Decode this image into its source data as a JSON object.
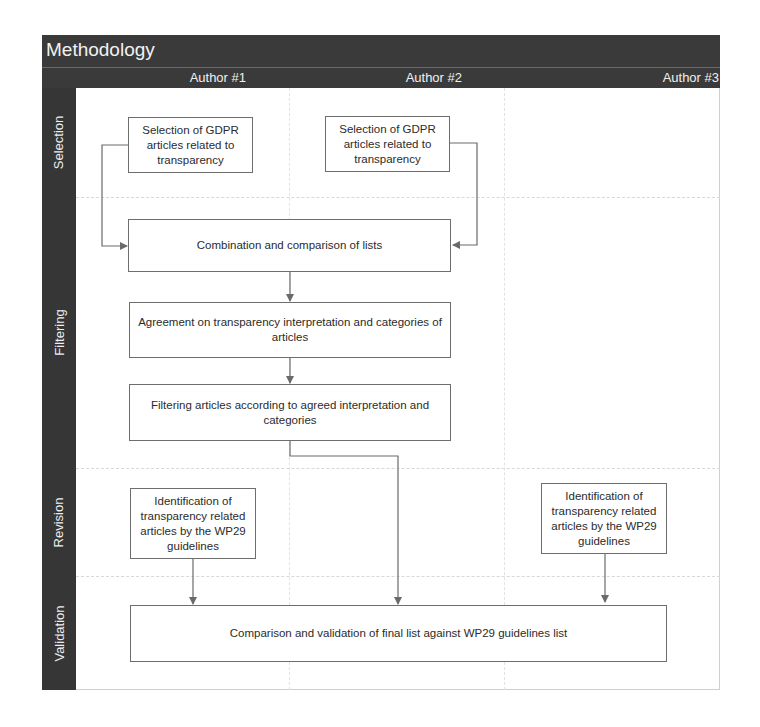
{
  "diagram": {
    "title": "Methodology",
    "columns": [
      {
        "label": "Author #1"
      },
      {
        "label": "Author #2"
      },
      {
        "label": "Author #3"
      }
    ],
    "lanes": [
      {
        "label": "Selection"
      },
      {
        "label": "Filtering"
      },
      {
        "label": "Revision"
      },
      {
        "label": "Validation"
      }
    ],
    "nodes": {
      "selection_a1": "Selection of GDPR articles related to transparency",
      "selection_a2": "Selection of GDPR articles related to transparency",
      "combination": "Combination and comparison of lists",
      "agreement": "Agreement on transparency interpretation and categories of articles",
      "filtering": "Filtering articles according to agreed interpretation and categories",
      "revision_a1": "Identification of transparency related articles by the WP29 guidelines",
      "revision_a3": "Identification of transparency related articles by the WP29 guidelines",
      "validation": "Comparison and validation of final list against WP29 guidelines list"
    },
    "edges": [
      {
        "from": "selection_a1",
        "to": "combination"
      },
      {
        "from": "selection_a2",
        "to": "combination"
      },
      {
        "from": "combination",
        "to": "agreement"
      },
      {
        "from": "agreement",
        "to": "filtering"
      },
      {
        "from": "filtering",
        "to": "validation"
      },
      {
        "from": "revision_a1",
        "to": "validation"
      },
      {
        "from": "revision_a3",
        "to": "validation"
      }
    ],
    "colors": {
      "header_bg": "#3a3a3a",
      "sidebar_bg": "#363636",
      "header_text": "#f2f2f2",
      "box_border": "#6e6e6e",
      "arrow": "#6a6a6a"
    }
  }
}
